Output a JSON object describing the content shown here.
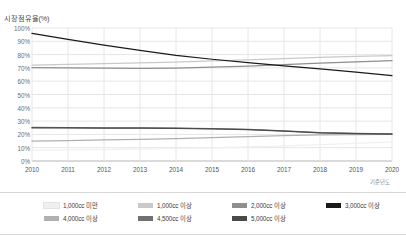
{
  "chart_data": {
    "type": "line",
    "title": "시장점유율(%)",
    "xlabel": "기준년도",
    "ylabel": "시장점유율(%)",
    "x": [
      2010,
      2011,
      2012,
      2013,
      2014,
      2015,
      2016,
      2017,
      2018,
      2019,
      2020
    ],
    "xtick_labels": [
      "2010",
      "2011",
      "2012",
      "2013",
      "2014",
      "2015",
      "2016",
      "2017",
      "2018",
      "2019",
      "2020"
    ],
    "ylim": [
      0,
      100
    ],
    "ytick_labels": [
      "100%",
      "90%",
      "80%",
      "70%",
      "60%",
      "50%",
      "40%",
      "30%",
      "20%",
      "10%",
      "0%"
    ],
    "ytick_values": [
      100,
      90,
      80,
      70,
      60,
      50,
      40,
      30,
      20,
      10,
      0
    ],
    "grid": true,
    "legend_position": "bottom",
    "series": [
      {
        "name": "1,000cc 미만",
        "color": "#f0f0f0",
        "values": [
          8.0,
          8.3,
          8.6,
          9.0,
          9.4,
          9.9,
          10.6,
          11.4,
          12.3,
          13.3,
          14.4
        ]
      },
      {
        "name": "1,000cc 이상",
        "color": "#c9c9c9",
        "values": [
          72.0,
          72.6,
          73.2,
          73.8,
          74.4,
          75.2,
          76.1,
          77.0,
          77.9,
          78.6,
          79.2
        ]
      },
      {
        "name": "2,000cc 이상",
        "color": "#8f8f8f",
        "values": [
          70.2,
          70.0,
          69.8,
          69.6,
          69.8,
          70.5,
          71.4,
          72.5,
          73.6,
          74.6,
          75.4
        ]
      },
      {
        "name": "3,000cc 이상",
        "color": "#1a1a1a",
        "values": [
          96.0,
          91.5,
          87.2,
          83.2,
          79.5,
          76.5,
          74.0,
          71.5,
          69.3,
          66.8,
          64.2
        ]
      },
      {
        "name": "4,000cc 이상",
        "color": "#b0b0b0",
        "values": [
          15.0,
          15.4,
          15.8,
          16.3,
          16.9,
          17.6,
          18.4,
          19.1,
          19.6,
          19.9,
          20.1
        ]
      },
      {
        "name": "4,500cc 이상",
        "color": "#707070",
        "values": [
          25.2,
          25.1,
          25.0,
          24.9,
          24.7,
          24.4,
          23.8,
          22.6,
          21.4,
          20.8,
          20.4
        ]
      },
      {
        "name": "5,000cc 이상",
        "color": "#4a4a4a",
        "values": [
          25.0,
          24.9,
          24.8,
          24.7,
          24.5,
          24.2,
          23.6,
          22.4,
          21.2,
          20.6,
          20.2
        ]
      }
    ],
    "legend": [
      {
        "label": "1,000cc 미만",
        "color": "#f0f0f0"
      },
      {
        "label": "1,000cc 이상",
        "color": "#c9c9c9"
      },
      {
        "label": "2,000cc 이상",
        "color": "#8f8f8f"
      },
      {
        "label": "3,000cc 이상",
        "color": "#1a1a1a"
      },
      {
        "label": "4,000cc 이상",
        "color": "#b0b0b0"
      },
      {
        "label": "4,500cc 이상",
        "color": "#707070"
      },
      {
        "label": "5,000cc 이상",
        "color": "#4a4a4a"
      }
    ]
  }
}
